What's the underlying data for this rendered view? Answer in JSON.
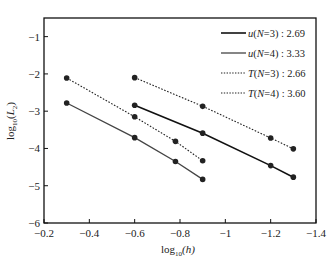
{
  "chart_data": {
    "type": "line",
    "title": "",
    "xlabel": "log10(h)",
    "ylabel": "log10(L2)",
    "xlim": [
      -0.2,
      -1.4
    ],
    "ylim": [
      -6,
      -0.5
    ],
    "xticks": [
      -0.2,
      -0.4,
      -0.6,
      -0.8,
      -1,
      -1.2,
      -1.4
    ],
    "xtick_labels": [
      "−0.2",
      "−0.4",
      "−0.6",
      "−0.8",
      "−1",
      "−1.2",
      "−1.4"
    ],
    "yticks": [
      -1,
      -2,
      -3,
      -4,
      -5,
      -6
    ],
    "ytick_labels": [
      "−1",
      "−2",
      "−3",
      "−4",
      "−5",
      "−6"
    ],
    "grid": false,
    "legend_position": "upper right",
    "series": [
      {
        "name": "u(N=3)",
        "rate": "2.69",
        "style": "solid",
        "color": "#111111",
        "width": 1.6,
        "x": [
          -0.6,
          -0.9,
          -1.2,
          -1.3
        ],
        "y": [
          -2.84,
          -3.59,
          -4.46,
          -4.77
        ]
      },
      {
        "name": "u(N=4)",
        "rate": "3.33",
        "style": "solid",
        "color": "#444444",
        "width": 1.3,
        "x": [
          -0.3,
          -0.6,
          -0.78,
          -0.9
        ],
        "y": [
          -2.78,
          -3.71,
          -4.35,
          -4.83
        ]
      },
      {
        "name": "T(N=3)",
        "rate": "2.66",
        "style": "dotted",
        "color": "#222222",
        "width": 1.1,
        "x": [
          -0.6,
          -0.9,
          -1.2,
          -1.3
        ],
        "y": [
          -2.1,
          -2.87,
          -3.72,
          -4.01
        ]
      },
      {
        "name": "T(N=4)",
        "rate": "3.60",
        "style": "dotted",
        "color": "#222222",
        "width": 1.1,
        "x": [
          -0.3,
          -0.6,
          -0.78,
          -0.9
        ],
        "y": [
          -2.11,
          -3.15,
          -3.81,
          -4.33
        ]
      }
    ]
  },
  "legend": {
    "items": [
      {
        "var": "u",
        "n": "3",
        "rate": "2.69"
      },
      {
        "var": "u",
        "n": "4",
        "rate": "3.33"
      },
      {
        "var": "T",
        "n": "3",
        "rate": "2.66"
      },
      {
        "var": "T",
        "n": "4",
        "rate": "3.60"
      }
    ]
  },
  "axes": {
    "xlabel_main": "log",
    "xlabel_sub": "10",
    "xlabel_arg": "(h)",
    "ylabel_main": "log",
    "ylabel_sub": "10",
    "ylabel_arg_open": "(",
    "ylabel_var": "L",
    "ylabel_var_sub": "2",
    "ylabel_arg_close": ")"
  }
}
